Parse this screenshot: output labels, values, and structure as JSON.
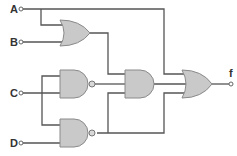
{
  "diagram": {
    "type": "logic-circuit",
    "inputs": [
      {
        "id": "A",
        "label": "A"
      },
      {
        "id": "B",
        "label": "B"
      },
      {
        "id": "C",
        "label": "C"
      },
      {
        "id": "D",
        "label": "D"
      }
    ],
    "output": {
      "id": "f",
      "label": "f"
    },
    "gates": [
      {
        "id": "g1",
        "type": "OR",
        "inputs": [
          "A",
          "B"
        ]
      },
      {
        "id": "g2",
        "type": "NAND",
        "inputs": [
          "C",
          "C"
        ]
      },
      {
        "id": "g3",
        "type": "NAND",
        "inputs": [
          "C",
          "D"
        ]
      },
      {
        "id": "g4",
        "type": "AND",
        "inputs": [
          "g1",
          "g2",
          "g3"
        ]
      },
      {
        "id": "g5",
        "type": "OR",
        "inputs": [
          "A",
          "g4",
          "g3"
        ]
      }
    ]
  }
}
